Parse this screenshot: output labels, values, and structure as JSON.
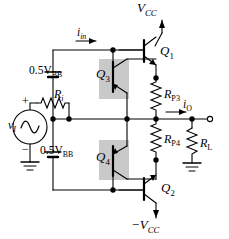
{
  "figure": {
    "type": "circuit-schematic"
  },
  "supplies": {
    "positive": "V",
    "positive_sub": "CC",
    "negative": "−V",
    "negative_sub": "CC"
  },
  "source": {
    "symbol": "v",
    "symbol_sub": "I",
    "plus": "+",
    "minus": "−",
    "resistor": "R",
    "resistor_sub": "i"
  },
  "bias": {
    "upper": "0.5V",
    "upper_sub": "BB",
    "lower": "0.5V",
    "lower_sub": "BB"
  },
  "transistors": {
    "q1": "Q",
    "q1_sub": "1",
    "q2": "Q",
    "q2_sub": "2",
    "q3": "Q",
    "q3_sub": "3",
    "q4": "Q",
    "q4_sub": "4"
  },
  "resistors": {
    "rp3": "R",
    "rp3_sub": "P3",
    "rp4": "R",
    "rp4_sub": "P4",
    "rl": "R",
    "rl_sub": "L"
  },
  "currents": {
    "input": "i",
    "input_sub": "in",
    "output": "i",
    "output_sub": "O"
  },
  "colors": {
    "wire": "#000000",
    "highlight": "#c9c9c9",
    "background": "#ffffff"
  }
}
